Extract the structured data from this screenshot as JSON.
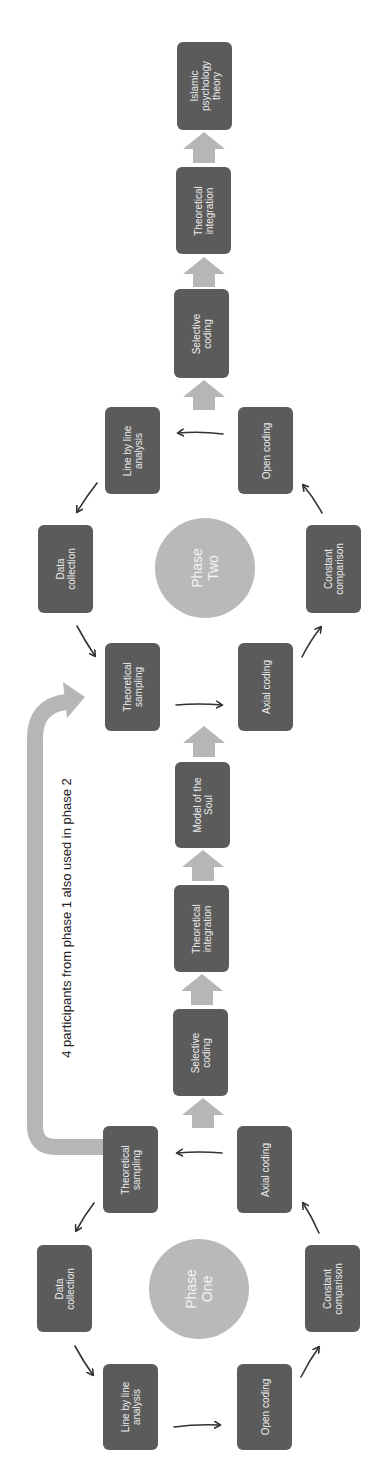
{
  "colors": {
    "node_fill": "#5b5b5b",
    "node_text": "#ececec",
    "phase_circle": "#b9b9b9",
    "block_arrow": "#b6b6b6",
    "thin_arrow": "#333333",
    "annotation_text": "#222222"
  },
  "annotation": "4 participants from phase 1 also used in phase 2",
  "phase_one": {
    "label": [
      "Phase",
      "One"
    ],
    "nodes": {
      "line_by_line": {
        "lines": [
          "Line by line",
          "analysis"
        ]
      },
      "open_coding": {
        "lines": [
          "Open coding"
        ]
      },
      "data_collection": {
        "lines": [
          "Data",
          "collection"
        ]
      },
      "constant_comparison": {
        "lines": [
          "Constant",
          "comparison"
        ]
      },
      "theoretical_sampling": {
        "lines": [
          "Theoretical",
          "sampling"
        ]
      },
      "axial_coding": {
        "lines": [
          "Axial coding"
        ]
      }
    },
    "output_chain": {
      "selective_coding": {
        "lines": [
          "Selective",
          "coding"
        ]
      },
      "theoretical_integration": {
        "lines": [
          "Theoretical",
          "integration"
        ]
      },
      "model_of_the_soul": {
        "lines": [
          "Model of the",
          "Soul"
        ]
      }
    }
  },
  "phase_two": {
    "label": [
      "Phase",
      "Two"
    ],
    "nodes": {
      "theoretical_sampling": {
        "lines": [
          "Theoretical",
          "sampling"
        ]
      },
      "axial_coding": {
        "lines": [
          "Axial coding"
        ]
      },
      "data_collection": {
        "lines": [
          "Data",
          "collection"
        ]
      },
      "constant_comparison": {
        "lines": [
          "Constant",
          "comparison"
        ]
      },
      "line_by_line": {
        "lines": [
          "Line by line",
          "analysis"
        ]
      },
      "open_coding": {
        "lines": [
          "Open coding"
        ]
      }
    },
    "output_chain": {
      "selective_coding": {
        "lines": [
          "Selective",
          "coding"
        ]
      },
      "theoretical_integration": {
        "lines": [
          "Theoretical",
          "integration"
        ]
      },
      "islamic_psychology_theory": {
        "lines": [
          "Islamic",
          "psychology",
          "theory"
        ]
      }
    }
  }
}
